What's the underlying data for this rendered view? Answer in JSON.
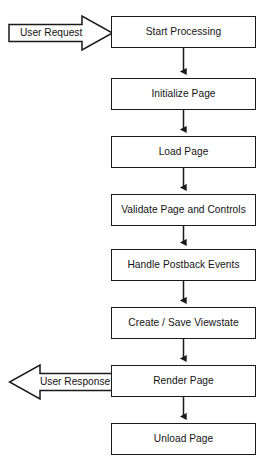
{
  "diagram": {
    "type": "flowchart",
    "orientation": "vertical",
    "background_color": "#ffffff",
    "stroke_color": "#1a1a1a",
    "text_color": "#141414",
    "nodes": [
      {
        "id": "start-processing",
        "label": "Start Processing"
      },
      {
        "id": "initialize-page",
        "label": "Initialize Page"
      },
      {
        "id": "load-page",
        "label": "Load Page"
      },
      {
        "id": "validate-page",
        "label": "Validate Page and Controls"
      },
      {
        "id": "handle-postback",
        "label": "Handle Postback Events"
      },
      {
        "id": "create-save-viewstate",
        "label": "Create / Save Viewstate"
      },
      {
        "id": "render-page",
        "label": "Render Page"
      },
      {
        "id": "unload-page",
        "label": "Unload Page"
      }
    ],
    "input_arrow": {
      "id": "user-request",
      "label": "User Request",
      "direction": "right",
      "target": "start-processing"
    },
    "output_arrow": {
      "id": "user-response",
      "label": "User Response",
      "direction": "left",
      "source": "render-page"
    },
    "connectors": [
      {
        "from": "start-processing",
        "to": "initialize-page",
        "style": "arrow-down"
      },
      {
        "from": "initialize-page",
        "to": "load-page",
        "style": "arrow-down"
      },
      {
        "from": "load-page",
        "to": "validate-page",
        "style": "arrow-down"
      },
      {
        "from": "validate-page",
        "to": "handle-postback",
        "style": "arrow-down"
      },
      {
        "from": "handle-postback",
        "to": "create-save-viewstate",
        "style": "arrow-down"
      },
      {
        "from": "create-save-viewstate",
        "to": "render-page",
        "style": "arrow-down"
      },
      {
        "from": "render-page",
        "to": "unload-page",
        "style": "arrow-down"
      }
    ]
  }
}
